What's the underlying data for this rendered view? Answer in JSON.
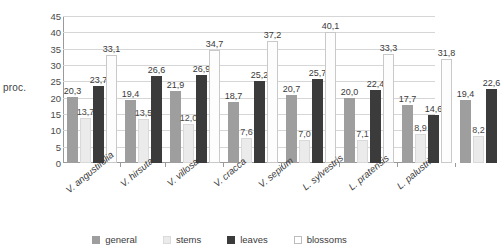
{
  "chart_data": {
    "type": "bar",
    "title": "",
    "xlabel": "",
    "ylabel": "proc.",
    "ylim": [
      0,
      45
    ],
    "ytick_step": 5,
    "yticks": [
      "0",
      "5",
      "10",
      "15",
      "20",
      "25",
      "30",
      "35",
      "40",
      "45"
    ],
    "grid": true,
    "legend_position": "bottom",
    "categories": [
      "V. angustifolia",
      "V. hirsuta",
      "V. villosa",
      "V. cracca",
      "V. sepium",
      "L. sylvestris",
      "L. pratensis",
      "L. palustris"
    ],
    "series": [
      {
        "name": "general",
        "color": "#9e9e9e",
        "values": [
          20.3,
          19.4,
          21.9,
          18.7,
          20.7,
          20.0,
          17.7,
          19.4
        ],
        "labels": [
          "20,3",
          "19,4",
          "21,9",
          "18,7",
          "20,7",
          "20,0",
          "17,7",
          "19,4"
        ]
      },
      {
        "name": "stems",
        "color": "#ebebeb",
        "values": [
          13.7,
          13.5,
          12.0,
          7.6,
          7.0,
          7.1,
          8.9,
          8.2
        ],
        "labels": [
          "13,7",
          "13,5",
          "12,0",
          "7,6",
          "7,0",
          "7,1",
          "8,9",
          "8,2"
        ]
      },
      {
        "name": "leaves",
        "color": "#3b3b3b",
        "values": [
          23.7,
          26.6,
          26.9,
          25.2,
          25.7,
          22.4,
          14.6,
          22.6
        ],
        "labels": [
          "23,7",
          "26,6",
          "26,9",
          "25,2",
          "25,7",
          "22,4",
          "14,6",
          "22,6"
        ]
      },
      {
        "name": "blossoms",
        "color": "#ffffff",
        "values": [
          33.1,
          null,
          34.7,
          37.2,
          40.1,
          33.3,
          31.8,
          null
        ],
        "labels": [
          "33,1",
          "",
          "34,7",
          "37,2",
          "40,1",
          "33,3",
          "31,8",
          ""
        ]
      }
    ]
  },
  "legend": {
    "items": [
      {
        "label": "general",
        "key": "general"
      },
      {
        "label": "stems",
        "key": "stems"
      },
      {
        "label": "leaves",
        "key": "leaves"
      },
      {
        "label": "blossoms",
        "key": "blossoms"
      }
    ]
  }
}
